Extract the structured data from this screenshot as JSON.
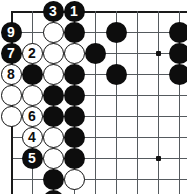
{
  "diagram": {
    "kind": "go-board-diagram",
    "board": {
      "cols": 9,
      "rows": 9,
      "cell_px": 21,
      "origin_x": 11,
      "origin_y": 11,
      "left_edge": true,
      "top_edge": true,
      "right_edge": false,
      "bottom_edge": false,
      "line_color": "#555a5e",
      "edge_color": "#1a1a1a",
      "background": "#ffffff"
    },
    "hoshi": [
      {
        "col": 7,
        "row": 2
      },
      {
        "col": 7,
        "row": 7
      }
    ],
    "stones": [
      {
        "col": 2,
        "row": 0,
        "color": "black",
        "label": "3"
      },
      {
        "col": 3,
        "row": 0,
        "color": "black",
        "label": "1"
      },
      {
        "col": 0,
        "row": 1,
        "color": "black",
        "label": "9"
      },
      {
        "col": 0,
        "row": 2,
        "color": "black",
        "label": "7"
      },
      {
        "col": 1,
        "row": 2,
        "color": "white",
        "label": "2"
      },
      {
        "col": 0,
        "row": 3,
        "color": "white",
        "label": "8"
      },
      {
        "col": 1,
        "row": 5,
        "color": "white",
        "label": "6"
      },
      {
        "col": 1,
        "row": 6,
        "color": "white",
        "label": "4"
      },
      {
        "col": 1,
        "row": 7,
        "color": "black",
        "label": "5"
      },
      {
        "col": 2,
        "row": 1,
        "color": "white",
        "label": ""
      },
      {
        "col": 3,
        "row": 1,
        "color": "black",
        "label": ""
      },
      {
        "col": 5,
        "row": 1,
        "color": "black",
        "label": ""
      },
      {
        "col": 8,
        "row": 1,
        "color": "black",
        "label": ""
      },
      {
        "col": 2,
        "row": 2,
        "color": "white",
        "label": ""
      },
      {
        "col": 3,
        "row": 2,
        "color": "white",
        "label": ""
      },
      {
        "col": 4,
        "row": 2,
        "color": "black",
        "label": ""
      },
      {
        "col": 8,
        "row": 2,
        "color": "black",
        "label": ""
      },
      {
        "col": 1,
        "row": 3,
        "color": "black",
        "label": ""
      },
      {
        "col": 2,
        "row": 3,
        "color": "white",
        "label": ""
      },
      {
        "col": 3,
        "row": 3,
        "color": "black",
        "label": ""
      },
      {
        "col": 5,
        "row": 3,
        "color": "black",
        "label": ""
      },
      {
        "col": 8,
        "row": 3,
        "color": "black",
        "label": ""
      },
      {
        "col": 0,
        "row": 4,
        "color": "white",
        "label": ""
      },
      {
        "col": 1,
        "row": 4,
        "color": "white",
        "label": ""
      },
      {
        "col": 2,
        "row": 4,
        "color": "black",
        "label": ""
      },
      {
        "col": 3,
        "row": 4,
        "color": "black",
        "label": ""
      },
      {
        "col": 0,
        "row": 5,
        "color": "white",
        "label": ""
      },
      {
        "col": 2,
        "row": 5,
        "color": "black",
        "label": ""
      },
      {
        "col": 3,
        "row": 5,
        "color": "black",
        "label": ""
      },
      {
        "col": 1,
        "row": 4.5,
        "color": "none",
        "label": ""
      },
      {
        "col": 2,
        "row": 6,
        "color": "white",
        "label": ""
      },
      {
        "col": 3,
        "row": 6,
        "color": "black",
        "label": ""
      },
      {
        "col": 2,
        "row": 7,
        "color": "white",
        "label": ""
      },
      {
        "col": 3,
        "row": 7,
        "color": "black",
        "label": ""
      },
      {
        "col": 2,
        "row": 8,
        "color": "black",
        "label": ""
      },
      {
        "col": 3,
        "row": 8,
        "color": "white",
        "label": ""
      },
      {
        "col": 2,
        "row": 9,
        "color": "black",
        "label": ""
      }
    ]
  }
}
